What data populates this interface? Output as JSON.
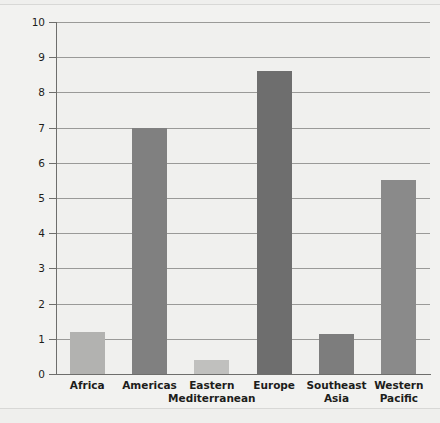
{
  "chart_data": {
    "type": "bar",
    "title": "",
    "xlabel": "",
    "ylabel": "Consumption in liters",
    "ylim": [
      0,
      10
    ],
    "ytick_labels": [
      "10",
      "9",
      "8",
      "7",
      "6",
      "5",
      "4",
      "3",
      "2",
      "1",
      "0"
    ],
    "ytick_values": [
      10,
      9,
      8,
      7,
      6,
      5,
      4,
      3,
      2,
      1,
      0
    ],
    "grid": true,
    "legend": "none",
    "categories": [
      "Africa",
      "Americas",
      "Eastern Mediterranean",
      "Europe",
      "Southeast Asia",
      "Western Pacific"
    ],
    "category_lines": [
      [
        "Africa"
      ],
      [
        "Americas"
      ],
      [
        "Eastern",
        "Mediterranean"
      ],
      [
        "Europe"
      ],
      [
        "Southeast",
        "Asia"
      ],
      [
        "Western",
        "Pacific"
      ]
    ],
    "values": [
      1.2,
      7.0,
      0.4,
      8.6,
      1.15,
      5.5
    ],
    "bar_colors": [
      "#b2b2b0",
      "#808080",
      "#c0c0be",
      "#6e6e6e",
      "#7d7d7d",
      "#8a8a8a"
    ]
  },
  "style": {
    "background": "#f0f0ee",
    "grid_color": "#9a9a98",
    "axis_color": "#6e6e6c",
    "text_color": "#1d1d1b"
  }
}
